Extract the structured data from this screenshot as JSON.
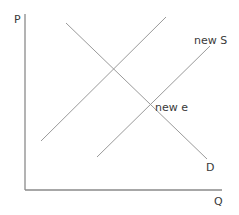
{
  "diagram": {
    "axes": {
      "y_label": "P",
      "x_label": "Q"
    },
    "curves": [
      {
        "id": "demand",
        "label": "D"
      },
      {
        "id": "original-supply",
        "label": ""
      },
      {
        "id": "new-supply",
        "label": "new S"
      }
    ],
    "points": [
      {
        "id": "new-equilibrium",
        "label": "new e"
      }
    ],
    "colors": {
      "axis": "#8a8a8a",
      "curve": "#9a9a9a",
      "text": "#3a3a3a"
    }
  }
}
